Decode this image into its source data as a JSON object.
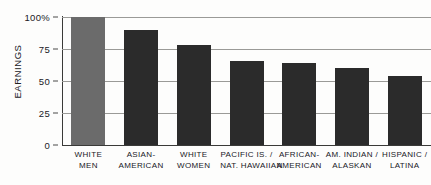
{
  "chart_data": {
    "type": "bar",
    "title": "",
    "xlabel": "",
    "ylabel": "EARNINGS",
    "ylim": [
      0,
      100
    ],
    "yticks": [
      0,
      25,
      50,
      75,
      100
    ],
    "ytick_labels": [
      "0",
      "25",
      "50",
      "75",
      "100%"
    ],
    "grid": true,
    "legend": "none",
    "categories": [
      "WHITE MEN",
      "ASIAN-AMERICAN",
      "WHITE WOMEN",
      "PACIFIC IS. / NAT. HAWAIIAN",
      "AFRICAN-AMERICAN",
      "AM. INDIAN / ALASKAN",
      "HISPANIC / LATINA"
    ],
    "category_lines": [
      [
        "WHITE",
        "MEN"
      ],
      [
        "ASIAN-",
        "AMERICAN"
      ],
      [
        "WHITE",
        "WOMEN"
      ],
      [
        "PACIFIC IS. /",
        "NAT. HAWAIIAN"
      ],
      [
        "AFRICAN-",
        "AMERICAN"
      ],
      [
        "AM. INDIAN /",
        "ALASKAN"
      ],
      [
        "HISPANIC /",
        "LATINA"
      ]
    ],
    "values": [
      100,
      90,
      78,
      66,
      64,
      60,
      54
    ],
    "bar_colors": [
      "#6b6b6b",
      "#2b2b2b",
      "#2b2b2b",
      "#2b2b2b",
      "#2b2b2b",
      "#2b2b2b",
      "#2b2b2b"
    ],
    "colors": {
      "reference_bar": "#6b6b6b",
      "data_bar": "#2b2b2b",
      "gridline": "#9a9a97",
      "axis": "#3a3a38",
      "text": "#20201f",
      "background": "#fdfdfc"
    }
  }
}
